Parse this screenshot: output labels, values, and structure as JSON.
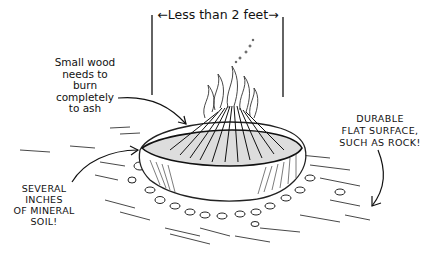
{
  "illustration": {
    "subject": "mound fire on flat durable surface",
    "dimension": {
      "label": "←Less than 2 feet→"
    },
    "annotations": {
      "wood": "Small wood\nneeds to\nburn\ncompletely\nto ash",
      "soil": "SEVERAL\nINCHES\nOF MINERAL\nSOIL!",
      "surface": "DURABLE\nFLAT SURFACE,\nSUCH AS ROCK!"
    },
    "colors": {
      "ink": "#111111",
      "background": "#ffffff"
    }
  }
}
